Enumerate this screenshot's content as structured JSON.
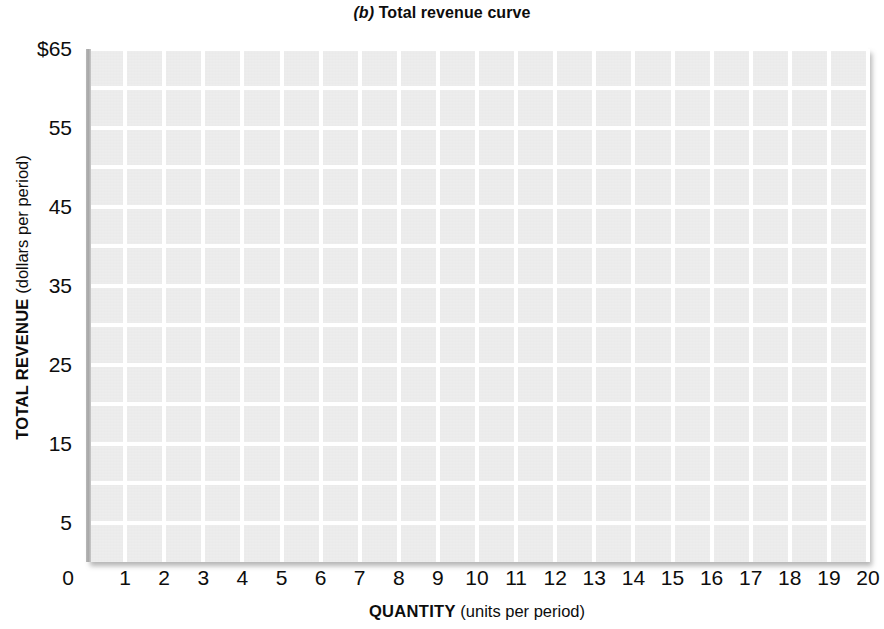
{
  "chart_data": {
    "type": "line",
    "title_panel_letter": "(b)",
    "title_text": "Total revenue curve",
    "xlabel_strong": "QUANTITY",
    "xlabel_unit": "(units per period)",
    "ylabel_strong": "TOTAL REVENUE",
    "ylabel_unit": "(dollars per period)",
    "xlim": [
      0,
      20
    ],
    "ylim": [
      0,
      65
    ],
    "x_tick_labels": [
      "0",
      "1",
      "2",
      "3",
      "4",
      "5",
      "6",
      "7",
      "8",
      "9",
      "10",
      "11",
      "12",
      "13",
      "14",
      "15",
      "16",
      "17",
      "18",
      "19",
      "20"
    ],
    "x_tick_values": [
      0,
      1,
      2,
      3,
      4,
      5,
      6,
      7,
      8,
      9,
      10,
      11,
      12,
      13,
      14,
      15,
      16,
      17,
      18,
      19,
      20
    ],
    "y_tick_labels": [
      "$65",
      "55",
      "45",
      "35",
      "25",
      "15",
      "5"
    ],
    "y_tick_values": [
      65,
      55,
      45,
      35,
      25,
      15,
      5
    ],
    "y_gridline_values": [
      5,
      10,
      15,
      20,
      25,
      30,
      35,
      40,
      45,
      50,
      55,
      60,
      65
    ],
    "x_gridline_values": [
      1,
      2,
      3,
      4,
      5,
      6,
      7,
      8,
      9,
      10,
      11,
      12,
      13,
      14,
      15,
      16,
      17,
      18,
      19,
      20
    ],
    "grid": true,
    "legend": null,
    "series": [],
    "annotations": [],
    "plot_background_color": "#ebebeb",
    "gridline_color": "#ffffff",
    "axis_rail_color": "#a6a6a6",
    "text_color": "#0d0d0d",
    "page_background_color": "#ffffff",
    "note": "Blank worksheet grid: no data curve is plotted."
  }
}
